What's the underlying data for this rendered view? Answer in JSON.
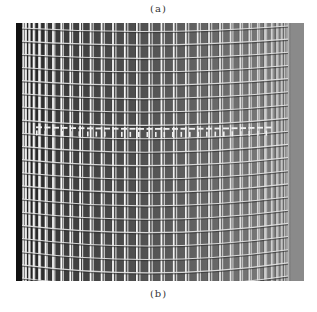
{
  "figure": {
    "caption_top": "(a)",
    "caption_bottom": "(b)",
    "colors": {
      "background_left": "#141414",
      "background_right": "#8c8c8c",
      "wire": "#e6e6e6",
      "wire_shadow": "#2a2a2a"
    },
    "mesh": {
      "vertical_bars": 34,
      "horizontal_rings": 20,
      "seam_band_y": 95
    }
  }
}
